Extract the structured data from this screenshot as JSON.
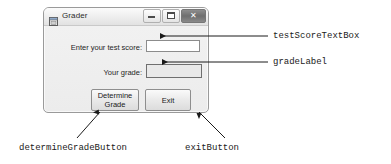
{
  "window": {
    "title": "Grader",
    "icon": "form-designer-icon",
    "controls": [
      {
        "name": "minimize-button",
        "glyph": "—"
      },
      {
        "name": "maximize-button",
        "glyph": "□"
      },
      {
        "name": "close-button",
        "glyph": "✕"
      }
    ],
    "fields": [
      {
        "label": "Enter your test score:",
        "control": "textbox",
        "value": ""
      },
      {
        "label": "Your grade:",
        "control": "label",
        "value": ""
      }
    ],
    "buttons": [
      {
        "label_line1": "Determine",
        "label_line2": "Grade"
      },
      {
        "label_line1": "Exit",
        "label_line2": ""
      }
    ]
  },
  "annotations": {
    "test_score_textbox": "testScoreTextBox",
    "grade_label": "gradeLabel",
    "determine_grade_button": "determineGradeButton",
    "exit_button": "exitButton"
  },
  "colors": {
    "window_border": "#9a9a9a",
    "titlebar": "#ededed",
    "close_button": "#7b7b7b",
    "textbox_bg": "#ffffff",
    "gradebox_bg": "#e9e9e9",
    "annotation_text": "#1a1a1a"
  }
}
